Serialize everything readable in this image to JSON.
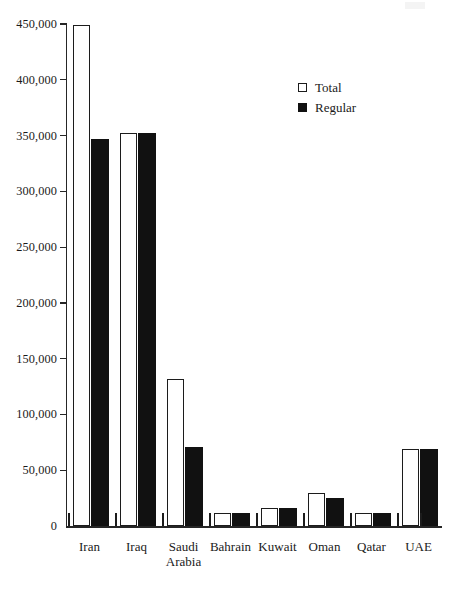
{
  "chart_data": {
    "type": "bar",
    "title": "",
    "subtitle": "",
    "xlabel": "",
    "ylabel": "",
    "ylim": [
      0,
      450000
    ],
    "yticks": [
      0,
      50000,
      100000,
      150000,
      200000,
      250000,
      300000,
      350000,
      400000,
      450000
    ],
    "ytick_labels": [
      "0",
      "50,000",
      "100,000",
      "150,000",
      "200,000",
      "250,000",
      "300,000",
      "350,000",
      "400,000",
      "450,000"
    ],
    "grid": false,
    "legend_position": "top-right",
    "categories": [
      "Iran",
      "Iraq",
      "Saudi Arabia",
      "Bahrain",
      "Kuwait",
      "Oman",
      "Qatar",
      "UAE"
    ],
    "category_lines": [
      [
        "Iran"
      ],
      [
        "Iraq"
      ],
      [
        "Saudi",
        "Arabia"
      ],
      [
        "Bahrain"
      ],
      [
        "Kuwait"
      ],
      [
        "Oman"
      ],
      [
        "Qatar"
      ],
      [
        "UAE"
      ]
    ],
    "series": [
      {
        "name": "Total",
        "color": "#ffffff",
        "edge_color": "#1c1c1c",
        "values": [
          449000,
          352000,
          132000,
          11500,
          16500,
          30000,
          12000,
          69000
        ]
      },
      {
        "name": "Regular",
        "color": "#111111",
        "edge_color": "#111111",
        "values": [
          347000,
          352000,
          71000,
          11500,
          16500,
          25500,
          12000,
          69000
        ]
      }
    ]
  },
  "legend": {
    "items": [
      {
        "label": "Total",
        "swatch": "hollow-square"
      },
      {
        "label": "Regular",
        "swatch": "filled-square"
      }
    ]
  },
  "axis": {
    "zero_label": "0"
  }
}
